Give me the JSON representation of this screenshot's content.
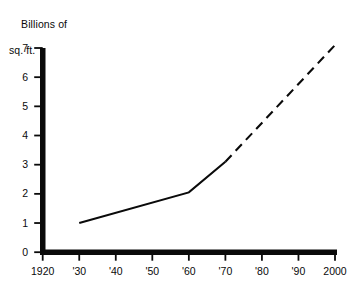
{
  "chart_data": {
    "type": "line",
    "title": "Billions of sq. ft.",
    "title_lines": [
      "Billions of",
      "sq. ft."
    ],
    "xlabel": "",
    "ylabel": "Billions of sq. ft.",
    "xlim": [
      1920,
      2000
    ],
    "ylim": [
      0,
      7
    ],
    "grid": false,
    "legend": null,
    "xticks": [
      1920,
      1930,
      1940,
      1950,
      1960,
      1970,
      1980,
      1990,
      2000
    ],
    "xtick_labels": [
      "1920",
      "'30",
      "'40",
      "'50",
      "'60",
      "'70",
      "'80",
      "'90",
      "2000"
    ],
    "yticks": [
      0,
      1,
      2,
      3,
      4,
      5,
      6,
      7
    ],
    "ytick_labels": [
      "0",
      "1",
      "2",
      "3",
      "4",
      "5",
      "6",
      "7"
    ],
    "series": [
      {
        "name": "Actual",
        "style": "solid",
        "color": "#0a0a0a",
        "x": [
          1930,
          1960,
          1970
        ],
        "values": [
          1.0,
          2.05,
          3.1
        ]
      },
      {
        "name": "Projected",
        "style": "dashed",
        "color": "#0a0a0a",
        "x": [
          1970,
          2000
        ],
        "values": [
          3.1,
          7.1
        ]
      }
    ],
    "colors": {
      "axis": "#0a0a0a",
      "line": "#0a0a0a",
      "background": "#ffffff",
      "text": "#0a0a0a"
    }
  }
}
